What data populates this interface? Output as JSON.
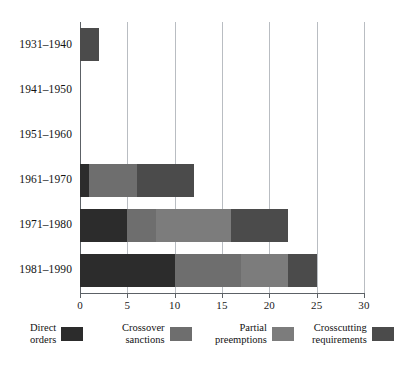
{
  "chart_data": {
    "type": "bar",
    "orientation": "horizontal",
    "stacked": true,
    "title": "",
    "subtitle": "",
    "xlabel": "",
    "ylabel": "",
    "categories": [
      "1931–1940",
      "1941–1950",
      "1951–1960",
      "1961–1970",
      "1971–1980",
      "1981–1990"
    ],
    "series": [
      {
        "name": "Direct orders",
        "color": "#2c2c2c",
        "values": [
          0,
          0,
          0,
          1,
          5,
          10
        ]
      },
      {
        "name": "Crossover sanctions",
        "color": "#6e6e6e",
        "values": [
          0,
          0,
          0,
          5,
          3,
          7
        ]
      },
      {
        "name": "Partial preemptions",
        "color": "#7c7c7c",
        "values": [
          0,
          0,
          0,
          0,
          8,
          5
        ]
      },
      {
        "name": "Crosscutting requirements",
        "color": "#4b4b4b",
        "values": [
          2,
          0,
          0,
          6,
          6,
          3
        ]
      }
    ],
    "totals": [
      2,
      0,
      0,
      12,
      22,
      25
    ],
    "xlim": [
      0,
      30
    ],
    "xticks": [
      0,
      5,
      10,
      15,
      20,
      25,
      30
    ],
    "xtick_labels": [
      "0",
      "5",
      "10",
      "15",
      "20",
      "25",
      "30"
    ],
    "grid": true,
    "grid_axis": "x",
    "legend_position": "bottom"
  },
  "legend": {
    "entries": [
      {
        "line1": "Direct",
        "line2": "orders",
        "color": "#2c2c2c"
      },
      {
        "line1": "Crossover",
        "line2": "sanctions",
        "color": "#6e6e6e"
      },
      {
        "line1": "Partial",
        "line2": "preemptions",
        "color": "#7c7c7c"
      },
      {
        "line1": "Crosscutting",
        "line2": "requirements",
        "color": "#4b4b4b"
      }
    ]
  },
  "axis": {
    "zero_line_color": "#5c6166",
    "grid_color": "#b9bdc2"
  }
}
